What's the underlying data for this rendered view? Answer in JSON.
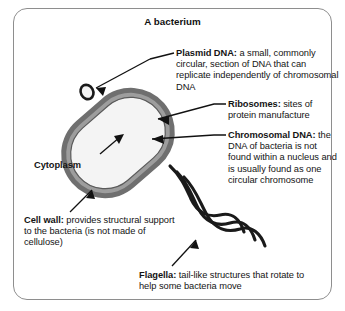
{
  "diagram": {
    "title": "A bacterium",
    "frame": {
      "border_color": "#8e8e8e"
    },
    "colors": {
      "cell_wall_outer": "#6f6f6f",
      "cell_wall_inner": "#a8a8a8",
      "cytoplasm": "#f2f2f2",
      "ribosome_dot": "#d4d4d4",
      "dna_stroke": "#1a1a1a",
      "text": "#141414",
      "flagella": "#1a1a1a"
    },
    "labels": [
      {
        "id": "plasmid-dna",
        "term": "Plasmid DNA:",
        "description": " a small, commonly circular, section of DNA that can replicate independently of chromosomal DNA"
      },
      {
        "id": "ribosomes",
        "term": "Ribosomes:",
        "description": " sites of protein manufacture"
      },
      {
        "id": "chromosomal-dna",
        "term": "Chromosomal DNA:",
        "description": " the DNA of bacteria is not found within a nucleus and is usually found as one circular chromosome"
      },
      {
        "id": "cytoplasm",
        "term": "Cytoplasm",
        "description": ""
      },
      {
        "id": "cell-wall",
        "term": "Cell wall:",
        "description": " provides structural support to the bacteria (is not made of cellulose)"
      },
      {
        "id": "flagella",
        "term": "Flagella:",
        "description": " tail-like structures that rotate to help some bacteria move"
      }
    ]
  }
}
